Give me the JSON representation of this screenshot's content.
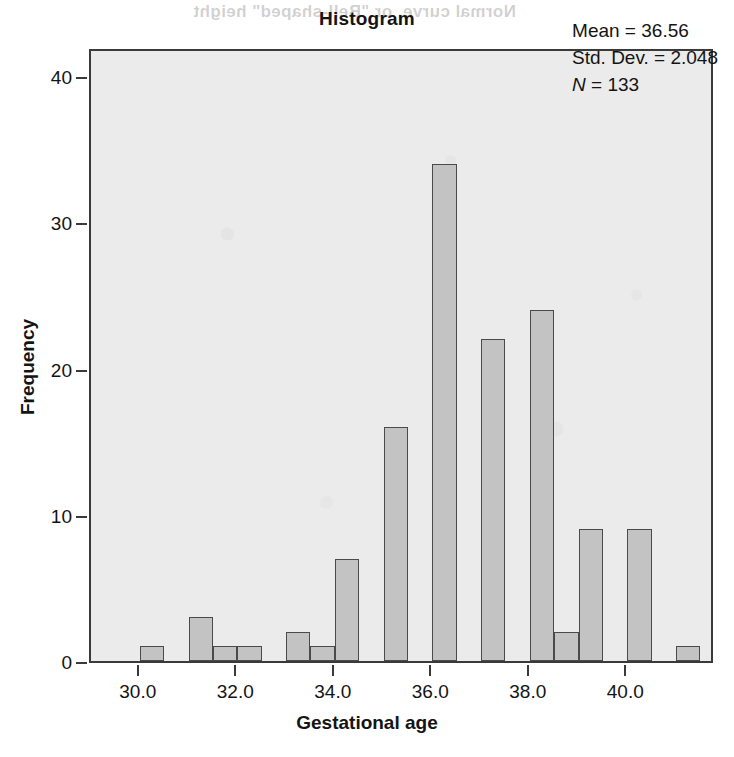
{
  "page": {
    "bleed_through_text": "Normal curve, or \"Bell-shaped\" height"
  },
  "chart_data": {
    "type": "bar",
    "title": "Histogram",
    "xlabel": "Gestational age",
    "ylabel": "Frequency",
    "xlim": [
      29.0,
      41.8
    ],
    "ylim": [
      0,
      42
    ],
    "grid": false,
    "legend": null,
    "bin_width": 0.5,
    "x_ticks": [
      30.0,
      32.0,
      34.0,
      36.0,
      38.0,
      40.0
    ],
    "x_tick_labels": [
      "30.0",
      "32.0",
      "34.0",
      "36.0",
      "38.0",
      "40.0"
    ],
    "y_ticks": [
      0,
      10,
      20,
      30,
      40
    ],
    "y_tick_labels": [
      "0",
      "10",
      "20",
      "30",
      "40"
    ],
    "bars": [
      {
        "x": 30.0,
        "value": 1
      },
      {
        "x": 31.0,
        "value": 3
      },
      {
        "x": 31.5,
        "value": 1
      },
      {
        "x": 32.0,
        "value": 1
      },
      {
        "x": 33.0,
        "value": 2
      },
      {
        "x": 33.5,
        "value": 1
      },
      {
        "x": 34.0,
        "value": 7
      },
      {
        "x": 35.0,
        "value": 16
      },
      {
        "x": 36.0,
        "value": 34
      },
      {
        "x": 37.0,
        "value": 22
      },
      {
        "x": 38.0,
        "value": 24
      },
      {
        "x": 38.5,
        "value": 2
      },
      {
        "x": 39.0,
        "value": 9
      },
      {
        "x": 40.0,
        "value": 9
      },
      {
        "x": 41.0,
        "value": 1
      }
    ],
    "categories": [
      "30.0",
      "31.0",
      "31.5",
      "32.0",
      "33.0",
      "33.5",
      "34.0",
      "35.0",
      "36.0",
      "37.0",
      "38.0",
      "38.5",
      "39.0",
      "40.0",
      "41.0"
    ],
    "values": [
      1,
      3,
      1,
      1,
      2,
      1,
      7,
      16,
      34,
      22,
      24,
      2,
      9,
      9,
      1
    ],
    "annotations": {
      "mean_label": "Mean = 36.56",
      "std_dev_label": "Std. Dev. = 2.048",
      "n_symbol": "N",
      "n_value_label": " = 133",
      "mean": 36.56,
      "std_dev": 2.048,
      "n": 133
    },
    "colors": {
      "bar_fill": "#c3c3c3",
      "bar_border": "#4a4a4a",
      "plot_background": "#ebebeb",
      "axis": "#3a3a3a",
      "text": "#141414"
    }
  }
}
